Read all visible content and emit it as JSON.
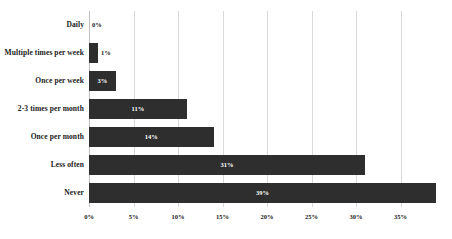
{
  "chart_data": {
    "type": "bar",
    "orientation": "horizontal",
    "title": "",
    "subtitle": "",
    "xlabel": "",
    "ylabel": "",
    "categories": [
      "Daily",
      "Multiple times per week",
      "Once per week",
      "2-3 times per month",
      "Once per month",
      "Less often",
      "Never"
    ],
    "values": [
      0,
      1,
      3,
      11,
      14,
      31,
      39
    ],
    "data_labels": [
      "0%",
      "1%",
      "3%",
      "11%",
      "14%",
      "31%",
      "39%"
    ],
    "xlim": [
      0,
      40
    ],
    "xticks": [
      0,
      5,
      10,
      15,
      20,
      25,
      30,
      35
    ],
    "xtick_labels": [
      "0%",
      "5%",
      "10%",
      "15%",
      "20%",
      "25%",
      "30%",
      "35%"
    ],
    "grid": true,
    "grid_axis": "x",
    "legend": false,
    "legend_position": "none",
    "bar_color": "#2e2e2e",
    "grid_color": "#d9d9d9",
    "background_color": "#ffffff",
    "label_color": "#1a1a1a",
    "value_label_color": "#ffffff"
  }
}
